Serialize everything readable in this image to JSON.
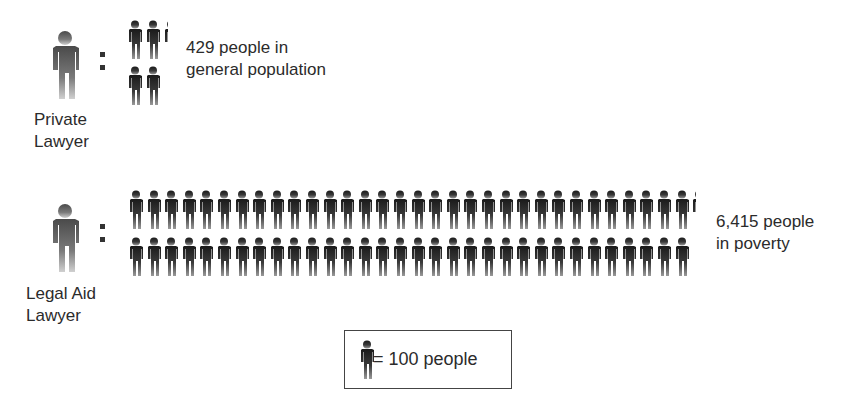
{
  "chart_data": {
    "type": "pictogram",
    "title": "",
    "unit": "1 figure = 100 people",
    "categories": [
      "Private Lawyer",
      "Legal Aid Lawyer"
    ],
    "values": [
      429,
      6415
    ],
    "figures": [
      4.29,
      64.15
    ],
    "descriptions": [
      "429 people in general population",
      "6,415 people in poverty"
    ],
    "legend": "= 100 people"
  },
  "rows": [
    {
      "label_lines": [
        "Private",
        "Lawyer"
      ],
      "desc_lines": [
        "429 people in",
        "general population"
      ],
      "value": 429
    },
    {
      "label_lines": [
        "Legal Aid",
        "Lawyer"
      ],
      "desc_lines": [
        "6,415 people",
        "in poverty"
      ],
      "value": 6415
    }
  ],
  "legend": {
    "text": "= 100 people",
    "per_icon": 100
  },
  "colors": {
    "figure_dark": "#1e1e1e",
    "figure_light": "#bdbdbd",
    "text": "#2b2b2b",
    "border": "#444444"
  }
}
